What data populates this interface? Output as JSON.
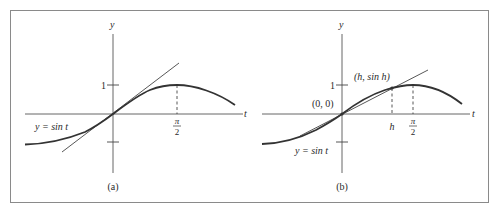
{
  "figure": {
    "frame_color": "#8a8a8a",
    "ink_color": "#2a2a2a",
    "curve_color": "#333333",
    "line_color": "#444444"
  },
  "panels": [
    {
      "id": "a",
      "caption": "(a)",
      "y_axis_label": "y",
      "t_axis_label": "t",
      "tick_label_one": "1",
      "pi_label_numerator": "π",
      "pi_label_denominator": "2",
      "curve_label": "y = sin t",
      "description": "Graph of y = sin t with tangent line y = t at origin"
    },
    {
      "id": "b",
      "caption": "(b)",
      "y_axis_label": "y",
      "t_axis_label": "t",
      "tick_label_one": "1",
      "pi_label_numerator": "π",
      "pi_label_denominator": "2",
      "h_label": "h",
      "origin_label": "(0, 0)",
      "point_label": "(h, sin h)",
      "curve_label": "y = sin t",
      "description": "Graph of y = sin t with secant line through (0,0) and (h, sin h)"
    }
  ]
}
